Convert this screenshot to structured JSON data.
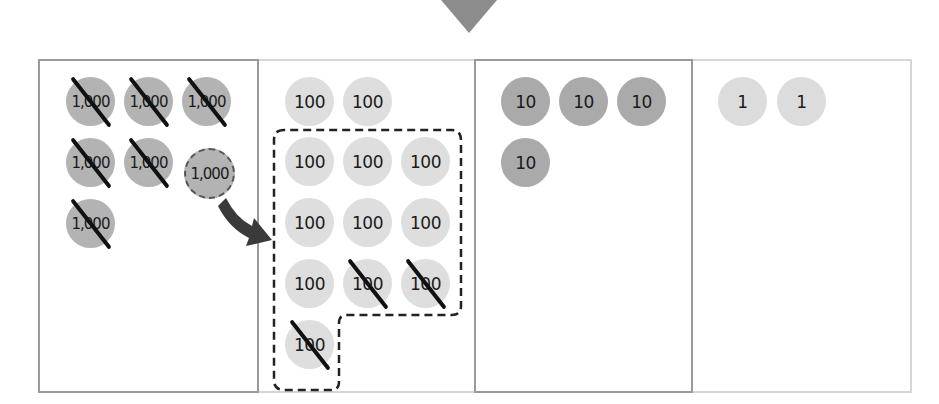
{
  "diagram": {
    "indicator": "down-arrow-triangle",
    "colors": {
      "thousand_disk": "#b3b3b3",
      "hundred_disk": "#dedede",
      "ten_disk": "#aaaaaa",
      "one_disk": "#dcdcdc",
      "strike": "#111111",
      "arrow": "#3a3a3a"
    },
    "columns": [
      {
        "name": "thousands",
        "disks": [
          {
            "label": "1,000",
            "crossed": true
          },
          {
            "label": "1,000",
            "crossed": true
          },
          {
            "label": "1,000",
            "crossed": true
          },
          {
            "label": "1,000",
            "crossed": true
          },
          {
            "label": "1,000",
            "crossed": true
          },
          {
            "label": "1,000",
            "crossed": false,
            "dashed": true,
            "regrouped": true
          },
          {
            "label": "1,000",
            "crossed": true
          }
        ]
      },
      {
        "name": "hundreds",
        "disks": [
          {
            "label": "100",
            "crossed": false
          },
          {
            "label": "100",
            "crossed": false
          },
          {
            "label": "100",
            "crossed": false
          },
          {
            "label": "100",
            "crossed": false
          },
          {
            "label": "100",
            "crossed": false
          },
          {
            "label": "100",
            "crossed": false
          },
          {
            "label": "100",
            "crossed": false
          },
          {
            "label": "100",
            "crossed": false
          },
          {
            "label": "100",
            "crossed": false
          },
          {
            "label": "100",
            "crossed": true
          },
          {
            "label": "100",
            "crossed": true
          },
          {
            "label": "100",
            "crossed": true
          }
        ],
        "regrouped_group_size": 10
      },
      {
        "name": "tens",
        "disks": [
          {
            "label": "10"
          },
          {
            "label": "10"
          },
          {
            "label": "10"
          },
          {
            "label": "10"
          }
        ]
      },
      {
        "name": "ones",
        "disks": [
          {
            "label": "1"
          },
          {
            "label": "1"
          }
        ]
      }
    ]
  }
}
